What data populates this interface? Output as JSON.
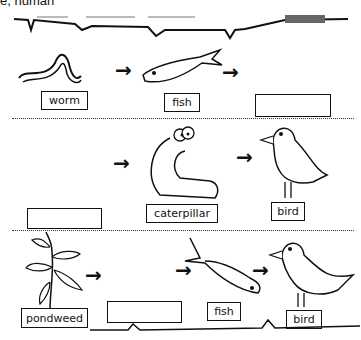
{
  "header": {
    "partial_text": "e, human"
  },
  "rows": [
    {
      "items": [
        {
          "label": "worm"
        },
        {
          "label": "fish"
        },
        {
          "label": ""
        }
      ]
    },
    {
      "items": [
        {
          "label": ""
        },
        {
          "label": "caterpillar"
        },
        {
          "label": "bird"
        }
      ]
    },
    {
      "items": [
        {
          "label": "pondweed"
        },
        {
          "label": ""
        },
        {
          "label": "fish"
        },
        {
          "label": "bird"
        }
      ]
    }
  ],
  "arrow_glyph": "→"
}
